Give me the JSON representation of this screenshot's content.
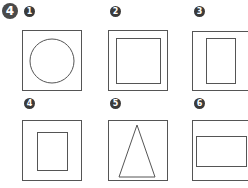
{
  "question": {
    "number": "4"
  },
  "options": [
    {
      "label": "1",
      "shape": "circle"
    },
    {
      "label": "2",
      "shape": "square"
    },
    {
      "label": "3",
      "shape": "tall-rectangle"
    },
    {
      "label": "4",
      "shape": "small-rectangle"
    },
    {
      "label": "5",
      "shape": "triangle"
    },
    {
      "label": "6",
      "shape": "wide-rectangle"
    }
  ]
}
